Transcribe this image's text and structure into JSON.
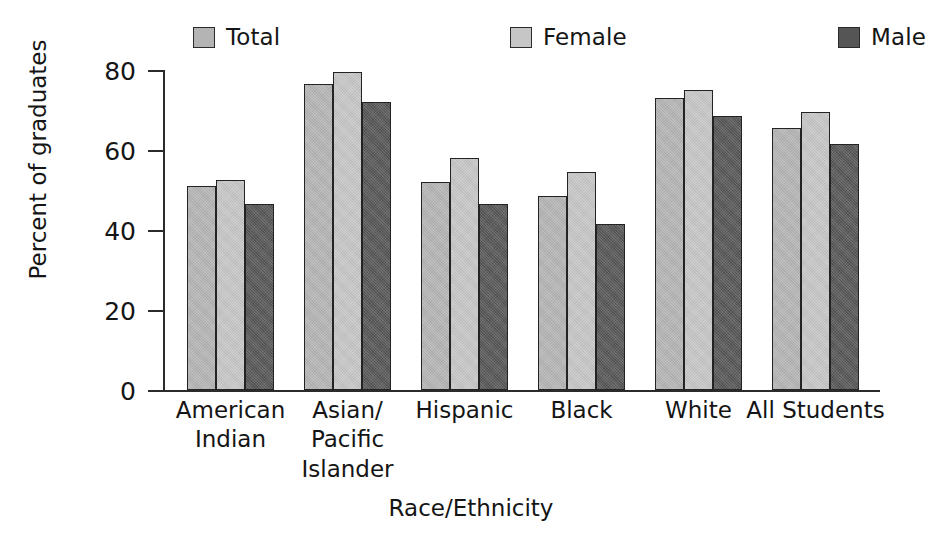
{
  "chart_data": {
    "type": "bar",
    "title": "",
    "xlabel": "Race/Ethnicity",
    "ylabel": "Percent of graduates",
    "categories": [
      "American\nIndian",
      "Asian/\nPacific\nIslander",
      "Hispanic",
      "Black",
      "White",
      "All Students"
    ],
    "series": [
      {
        "name": "Total",
        "color": "#b4b4b4",
        "values": [
          51.0,
          76.5,
          52.0,
          48.5,
          73.0,
          65.5
        ]
      },
      {
        "name": "Female",
        "color": "#c6c6c6",
        "values": [
          52.5,
          79.5,
          58.0,
          54.5,
          75.0,
          69.5
        ]
      },
      {
        "name": "Male",
        "color": "#555555",
        "values": [
          46.5,
          72.0,
          46.5,
          41.5,
          68.5,
          61.5
        ]
      }
    ],
    "ylim": [
      0,
      80
    ],
    "yticks": [
      0,
      20,
      40,
      60,
      80
    ],
    "ytick_labels": [
      "0",
      "20",
      "40",
      "60",
      "80"
    ],
    "grid": false,
    "legend_position": "top"
  },
  "legend": {
    "items": [
      {
        "label": "Total",
        "swatch_color": "#b4b4b4",
        "x": 193
      },
      {
        "label": "Female",
        "swatch_color": "#c6c6c6",
        "x": 510
      },
      {
        "label": "Male",
        "swatch_color": "#555555",
        "x": 838
      }
    ]
  },
  "axes": {
    "y_axis_title": "Percent of graduates",
    "x_axis_title": "Race/Ethnicity"
  }
}
